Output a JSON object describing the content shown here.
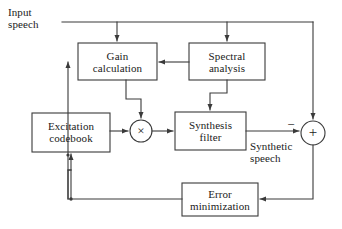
{
  "diagram": {
    "line_color": "#3a3a3a",
    "text_color": "#1a1a1a",
    "background": "#ffffff",
    "blocks": [
      {
        "id": "gain-calculation",
        "label": "Gain\ncalculation",
        "x": 78,
        "y": 43,
        "w": 79,
        "h": 37
      },
      {
        "id": "spectral-analysis",
        "label": "Spectral\nanalysis",
        "x": 189,
        "y": 43,
        "w": 76,
        "h": 37
      },
      {
        "id": "excitation-codebook",
        "label": "Excitation\ncodebook",
        "x": 32,
        "y": 113,
        "w": 78,
        "h": 39
      },
      {
        "id": "synthesis-filter",
        "label": "Synthesis\nfilter",
        "x": 175,
        "y": 112,
        "w": 71,
        "h": 38
      },
      {
        "id": "error-minimization",
        "label": "Error\nminimization",
        "x": 182,
        "y": 183,
        "w": 76,
        "h": 33
      }
    ],
    "operators": [
      {
        "id": "multiplier",
        "symbol": "×",
        "cx": 141,
        "cy": 131,
        "r": 11
      },
      {
        "id": "summer",
        "symbol": "+",
        "cx": 313,
        "cy": 133,
        "r": 12
      }
    ],
    "labels": [
      {
        "id": "input-speech-label",
        "text": "Input\nspeech",
        "x": 8,
        "y": 6
      },
      {
        "id": "synthetic-speech-label",
        "text": "Synthetic\nspeech",
        "x": 250,
        "y": 140
      },
      {
        "id": "minus-sign-label",
        "text": "−",
        "x": 288,
        "y": 120
      }
    ]
  }
}
